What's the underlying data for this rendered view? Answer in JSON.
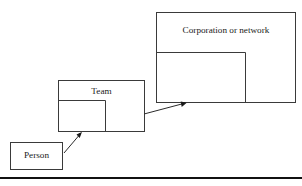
{
  "figure": {
    "type": "nested-scale-diagram",
    "background_color": "#ffffff",
    "stroke_color": "#3a3a3a",
    "text_color": "#1a1a1a",
    "rule_color": "#111111",
    "boxes": [
      {
        "id": "person",
        "label": "Person",
        "x": 10,
        "y": 142,
        "width": 53,
        "height": 28
      },
      {
        "id": "team",
        "label": "Team",
        "x": 58,
        "y": 80,
        "width": 87,
        "height": 52,
        "inner_partition": {
          "x": 58,
          "y": 100,
          "width": 47,
          "height": 32
        }
      },
      {
        "id": "corporation",
        "label": "Corporation or network",
        "x": 156,
        "y": 12,
        "width": 140,
        "height": 91,
        "inner_partition": {
          "x": 156,
          "y": 52,
          "width": 89,
          "height": 51
        }
      }
    ],
    "arrows": [
      {
        "id": "person-to-team",
        "from_box": "person",
        "to_box": "team",
        "x1": 64,
        "y1": 153,
        "x2": 81,
        "y2": 133
      },
      {
        "id": "team-to-corporation",
        "from_box": "team",
        "to_box": "corporation",
        "x1": 144,
        "y1": 114,
        "x2": 185,
        "y2": 103
      }
    ],
    "bottom_rule": {
      "x": 0,
      "y": 177,
      "width": 302,
      "height": 2
    }
  }
}
